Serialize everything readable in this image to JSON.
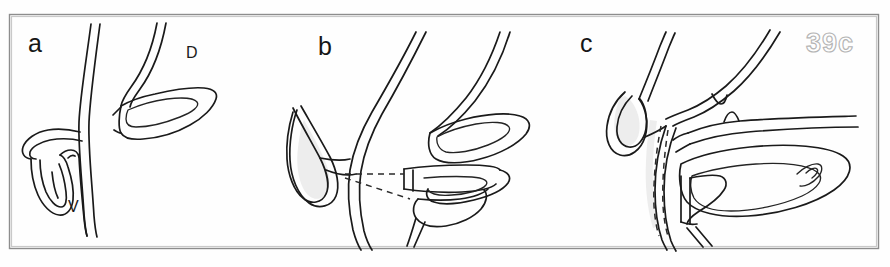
{
  "figure": {
    "number_label": "39c",
    "background_color": "#fefefe",
    "frame_color": "#8d8d8d",
    "ink_color": "#1a1a1a",
    "shading_color": "#ededed",
    "figure_number_stroke": "#b4b4b4",
    "width": 890,
    "height": 267
  },
  "panels": [
    {
      "id": "a",
      "letter": "a",
      "letter_x": 28,
      "letter_y": 52,
      "annotations": [
        {
          "text": "D",
          "x": 186,
          "y": 58
        },
        {
          "text": "V",
          "x": 68,
          "y": 212
        }
      ],
      "has_dashed_lines": false,
      "has_shading": false
    },
    {
      "id": "b",
      "letter": "b",
      "letter_x": 318,
      "letter_y": 55,
      "annotations": [],
      "has_dashed_lines": true,
      "has_shading": true
    },
    {
      "id": "c",
      "letter": "c",
      "letter_x": 580,
      "letter_y": 52,
      "annotations": [],
      "has_dashed_lines": true,
      "has_shading": true
    }
  ]
}
